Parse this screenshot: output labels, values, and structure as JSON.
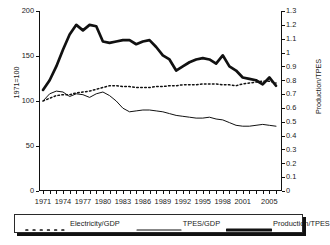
{
  "chart_data": {
    "type": "line",
    "title": "",
    "xlabel": "",
    "ylabel": "1971=100",
    "y2label": "Production/TPES",
    "x": [
      1971,
      1972,
      1973,
      1974,
      1975,
      1976,
      1977,
      1978,
      1979,
      1980,
      1981,
      1982,
      1983,
      1984,
      1985,
      1986,
      1987,
      1988,
      1989,
      1990,
      1991,
      1992,
      1993,
      1994,
      1995,
      1996,
      1997,
      1998,
      1999,
      2000,
      2001,
      2002,
      2003,
      2004,
      2005,
      2006
    ],
    "xtick_labels": [
      "1971",
      "1974",
      "1977",
      "1980",
      "1983",
      "1986",
      "1989",
      "1992",
      "1995",
      "1998",
      "2001",
      "2005"
    ],
    "xtick_values": [
      1971,
      1974,
      1977,
      1980,
      1983,
      1986,
      1989,
      1992,
      1995,
      1998,
      2001,
      2005
    ],
    "ylim": [
      0,
      200
    ],
    "ytick_labels": [
      "0",
      "50",
      "100",
      "150",
      "200"
    ],
    "ytick_values": [
      0,
      50,
      100,
      150,
      200
    ],
    "y2lim": [
      0,
      1.3
    ],
    "y2tick_labels": [
      "0",
      "0.1",
      "0.2",
      "0.3",
      "0.4",
      "0.5",
      "0.6",
      "0.7",
      "0.8",
      "0.9",
      "1",
      "1.1",
      "1.2",
      "1.3"
    ],
    "y2tick_values": [
      0,
      0.1,
      0.2,
      0.3,
      0.4,
      0.5,
      0.6,
      0.7,
      0.8,
      0.9,
      1.0,
      1.1,
      1.2,
      1.3
    ],
    "grid": false,
    "legend_position": "bottom",
    "series": [
      {
        "name": "Electricity/GDP",
        "style": "dotted",
        "axis": "left",
        "values": [
          100,
          103,
          106,
          107,
          107,
          109,
          110,
          111,
          113,
          115,
          117,
          117,
          116,
          116,
          115,
          115,
          115,
          116,
          116,
          117,
          117,
          118,
          118,
          118,
          119,
          119,
          119,
          118,
          118,
          117,
          119,
          120,
          121,
          122,
          122,
          120
        ]
      },
      {
        "name": "TPES/GDP",
        "style": "thin",
        "axis": "left",
        "values": [
          100,
          108,
          111,
          110,
          105,
          108,
          107,
          104,
          108,
          110,
          106,
          100,
          92,
          88,
          89,
          90,
          90,
          89,
          88,
          86,
          84,
          83,
          82,
          81,
          81,
          82,
          80,
          79,
          76,
          73,
          72,
          72,
          73,
          74,
          73,
          72
        ]
      },
      {
        "name": "Production/TPES",
        "style": "thick",
        "axis": "right",
        "values": [
          0.73,
          0.8,
          0.9,
          1.02,
          1.13,
          1.2,
          1.16,
          1.2,
          1.19,
          1.08,
          1.07,
          1.08,
          1.09,
          1.09,
          1.06,
          1.08,
          1.09,
          1.04,
          0.98,
          0.95,
          0.87,
          0.9,
          0.93,
          0.95,
          0.96,
          0.95,
          0.92,
          0.98,
          0.9,
          0.87,
          0.82,
          0.81,
          0.8,
          0.77,
          0.82,
          0.76
        ]
      }
    ]
  },
  "legend": {
    "entries": [
      {
        "label": "Electricity/GDP",
        "style": "dotted"
      },
      {
        "label": "TPES/GDP",
        "style": "thin"
      },
      {
        "label": "Production/TPES",
        "style": "thick"
      }
    ]
  }
}
